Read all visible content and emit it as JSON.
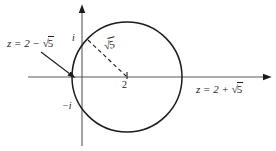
{
  "figure": {
    "name": "complex-plane-circle-diagram",
    "background_color": "#ffffff",
    "ink_color": "#1b1b1b",
    "width": 276,
    "height": 151
  },
  "axes": {
    "real_axis": {
      "name": "real-axis",
      "y": 77,
      "x_start": 28,
      "x_end": 268,
      "arrow": "right"
    },
    "imaginary_axis": {
      "name": "imaginary-axis",
      "x": 82,
      "y_start": 8,
      "y_end": 148,
      "arrow": "up"
    }
  },
  "circle": {
    "name": "solution-circle",
    "center_x": 127,
    "center_y": 77,
    "radius": 55,
    "stroke_width": 1.4
  },
  "tick_marks": [
    {
      "name": "tick-center-2",
      "x": 127,
      "y": 77
    }
  ],
  "radius_line": {
    "name": "radius-dashed-line",
    "x1": 88,
    "y1": 40,
    "x2": 127,
    "y2": 77,
    "dash": "4 3"
  },
  "callout_arrow": {
    "name": "left-intersection-callout-arrow",
    "x1": 41,
    "y1": 52,
    "x2": 72,
    "y2": 76
  },
  "labels": {
    "left_intersection": {
      "name": "label-left-intersection",
      "prefix": "z = 2 − ",
      "radical": "√",
      "radicand": "5",
      "full_text": "z = 2 − √5"
    },
    "right_intersection": {
      "name": "label-right-intersection",
      "prefix": "z = 2 + ",
      "radical": "√",
      "radicand": "5",
      "full_text": "z = 2 + √5"
    },
    "radius": {
      "name": "label-radius",
      "radical": "√",
      "radicand": "5",
      "full_text": "√5"
    },
    "imaginary_unit_positive": {
      "name": "label-i",
      "text": "i"
    },
    "imaginary_unit_negative": {
      "name": "label-negative-i",
      "text": "−i"
    },
    "real_center": {
      "name": "label-2",
      "text": "2"
    }
  }
}
